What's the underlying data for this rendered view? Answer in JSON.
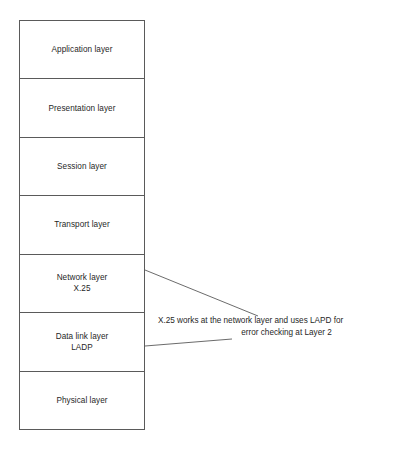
{
  "diagram": {
    "background_color": "#ffffff",
    "line_color": "#5a5a5a",
    "text_color": "#1f1f1f",
    "stack": {
      "name": "osi-model-stack",
      "layers": [
        {
          "label": "Application layer",
          "sub": ""
        },
        {
          "label": "Presentation layer",
          "sub": ""
        },
        {
          "label": "Session layer",
          "sub": ""
        },
        {
          "label": "Transport layer",
          "sub": ""
        },
        {
          "label": "Network layer",
          "sub": "X.25"
        },
        {
          "label": "Data link layer",
          "sub": "LADP"
        },
        {
          "label": "Physical layer",
          "sub": ""
        }
      ]
    },
    "annotation": {
      "line_1": "X.25 works at the network layer and uses LAPD for",
      "line_2": "error checking at Layer 2",
      "full_text": "X.25 works at the network layer and uses LAPD for error checking at Layer 2"
    },
    "leaders": [
      {
        "name": "network-layer-leader",
        "from": "network-layer-right-edge",
        "x1": 145,
        "y1": 270,
        "x2": 258,
        "y2": 316
      },
      {
        "name": "data-link-layer-leader",
        "from": "data-link-layer-right-edge",
        "x1": 145,
        "y1": 346,
        "x2": 232,
        "y2": 339
      }
    ]
  }
}
